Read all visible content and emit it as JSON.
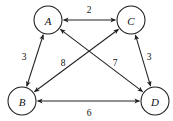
{
  "diagram": {
    "type": "weighted-undirected-graph",
    "title": "",
    "canvas": {
      "width": 173,
      "height": 121
    },
    "style": {
      "node_fill": "#ffffff",
      "node_stroke": "#1a1a1a",
      "edge_color": "#222222",
      "label_color": "#111111",
      "background": "#ffffff"
    },
    "nodes": [
      {
        "id": "A",
        "label": "A",
        "cx": 48,
        "cy": 20,
        "r": 14
      },
      {
        "id": "C",
        "label": "C",
        "cx": 131,
        "cy": 20,
        "r": 14
      },
      {
        "id": "B",
        "label": "B",
        "cx": 22,
        "cy": 101,
        "r": 14
      },
      {
        "id": "D",
        "label": "D",
        "cx": 155,
        "cy": 101,
        "r": 14
      }
    ],
    "edges": [
      {
        "id": "AC",
        "from": "A",
        "to": "C",
        "weight": "2",
        "bidirectional": true,
        "label_x": 89,
        "label_y": 10
      },
      {
        "id": "AB",
        "from": "A",
        "to": "B",
        "weight": "3",
        "bidirectional": true,
        "label_x": 24,
        "label_y": 57
      },
      {
        "id": "CD",
        "from": "C",
        "to": "D",
        "weight": "3",
        "bidirectional": true,
        "label_x": 149,
        "label_y": 57
      },
      {
        "id": "BC",
        "from": "B",
        "to": "C",
        "weight": "8",
        "bidirectional": true,
        "label_x": 63,
        "label_y": 63
      },
      {
        "id": "AD",
        "from": "A",
        "to": "D",
        "weight": "7",
        "bidirectional": true,
        "label_x": 115,
        "label_y": 63
      },
      {
        "id": "BD",
        "from": "B",
        "to": "D",
        "weight": "6",
        "bidirectional": true,
        "label_x": 89,
        "label_y": 113
      }
    ]
  }
}
